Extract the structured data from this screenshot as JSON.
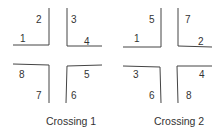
{
  "crossings": [
    {
      "caption": "Crossing 1",
      "labels": {
        "tl_outer": "1",
        "tl_inner": "2",
        "tr_inner": "3",
        "tr_outer": "4",
        "bl_outer": "8",
        "bl_inner": "7",
        "br_outer": "5",
        "br_inner": "6"
      }
    },
    {
      "caption": "Crossing 2",
      "labels": {
        "tl_outer": "1",
        "tl_inner": "5",
        "tr_inner": "7",
        "tr_outer": "2",
        "bl_outer": "3",
        "bl_inner": "6",
        "br_outer": "4",
        "br_inner": "8"
      }
    }
  ],
  "colors": {
    "line": "#444444",
    "text": "#333333"
  }
}
